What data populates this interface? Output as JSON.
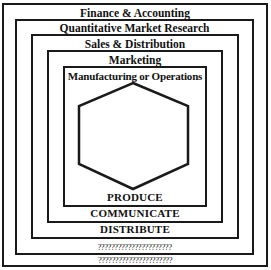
{
  "diagram": {
    "type": "nested-boxes",
    "layers": [
      {
        "id": "outer",
        "top_label": "Finance & Accounting",
        "bottom_label": "??????????????????????"
      },
      {
        "id": "second",
        "top_label": "Quantitative Market Research",
        "bottom_label": "??????????????????????"
      },
      {
        "id": "third",
        "top_label": "Sales & Distribution",
        "bottom_label": "DISTRIBUTE"
      },
      {
        "id": "fourth",
        "top_label": "Marketing",
        "bottom_label": "COMMUNICATE"
      },
      {
        "id": "inner",
        "top_label": "Manufacturing or Operations",
        "bottom_label": "PRODUCE"
      }
    ],
    "center_shape": "hexagon",
    "colors": {
      "line": "#1a1a1a",
      "text": "#111111",
      "background": "#ffffff"
    }
  }
}
